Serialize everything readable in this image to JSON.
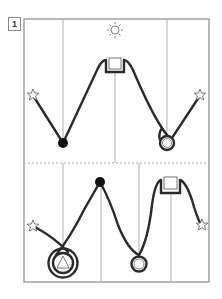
{
  "figure": {
    "label": "1",
    "colors": {
      "frame": "#8a8a8a",
      "guide": "#b0b0b0",
      "path": "#2a2a2a",
      "dot": "#111111",
      "icon_stroke": "#555555"
    },
    "top_panel": {
      "icons": [
        "sun-icon",
        "star-icon-left",
        "black-dot",
        "square-peak",
        "loop-circle",
        "star-icon-right"
      ]
    },
    "bottom_panel": {
      "icons": [
        "star-icon-left",
        "triangle-spiral",
        "black-dot",
        "loop-circle",
        "square-peak",
        "star-icon-right"
      ]
    }
  }
}
